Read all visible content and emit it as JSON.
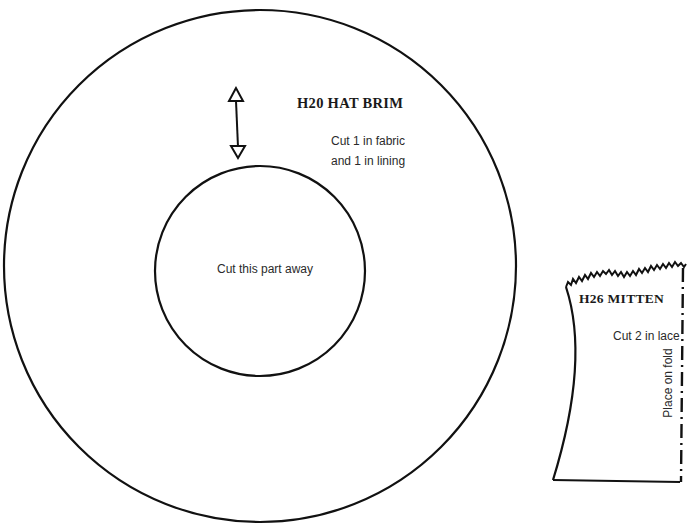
{
  "hat_brim": {
    "title": "H20  HAT BRIM",
    "instructions": [
      "Cut 1 in fabric",
      "and 1 in lining"
    ],
    "center_label": "Cut this part away",
    "grainline_icon": "double-arrow-grainline"
  },
  "mitten": {
    "title": "H26  MITTEN",
    "instruction": "Cut 2 in lace",
    "fold_label": "Place on fold",
    "fold_line_style": "dash-dot"
  },
  "colors": {
    "line": "#111111",
    "text": "#2a2a2a",
    "background": "#ffffff"
  }
}
